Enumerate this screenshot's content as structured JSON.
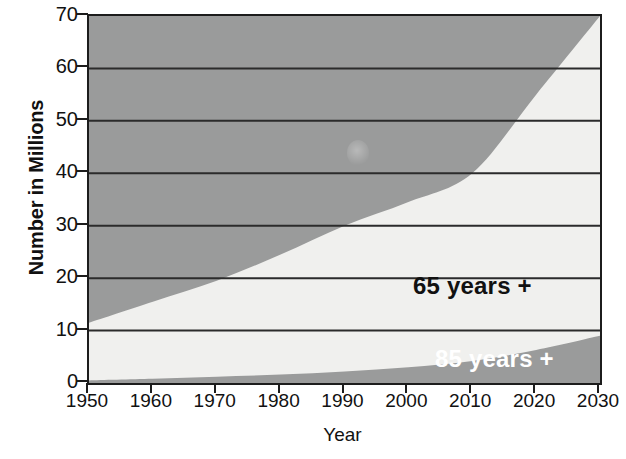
{
  "chart_data": {
    "type": "area",
    "title": "",
    "subtitle": "",
    "xlabel": "Year",
    "ylabel": "Number in Millions",
    "xlim": [
      1950,
      2030
    ],
    "ylim": [
      0,
      70
    ],
    "xticks": [
      1950,
      1960,
      1970,
      1980,
      1990,
      2000,
      2010,
      2020,
      2030
    ],
    "yticks": [
      0,
      10,
      20,
      30,
      40,
      50,
      60,
      70
    ],
    "xtick_labels": [
      "1950",
      "1960",
      "1970",
      "1980",
      "1990",
      "2000",
      "2010",
      "2020",
      "2030"
    ],
    "ytick_labels": [
      "0",
      "10",
      "20",
      "30",
      "40",
      "50",
      "60",
      "70"
    ],
    "grid": true,
    "grid_axis": "y",
    "stacked": true,
    "legend": "in-plot annotations",
    "x": [
      1950,
      1960,
      1970,
      1980,
      1990,
      2000,
      2010,
      2020,
      2030
    ],
    "series": [
      {
        "name": "65 years +",
        "label": "65 years +",
        "color": "#f0f0ee",
        "label_color": "#111111",
        "values": [
          11.5,
          15.5,
          19.5,
          24.5,
          30.0,
          34.5,
          40.0,
          55.0,
          70.0
        ]
      },
      {
        "name": "85 years +",
        "label": "85 years +",
        "color": "#9a9b9b",
        "label_color": "#ffffff",
        "values": [
          0.5,
          0.8,
          1.2,
          1.6,
          2.2,
          3.0,
          4.2,
          6.3,
          9.0
        ]
      }
    ],
    "colors": {
      "background_above_area": "#9a9b9b",
      "area_65_plus": "#f0f0ee",
      "area_85_plus": "#9a9b9b",
      "gridline": "#2b2b2b",
      "axis": "#1c1c1c",
      "text": "#111111",
      "figure_background": "#ffffff"
    }
  },
  "axes": {
    "y_title": "Number in Millions",
    "x_title": "Year"
  }
}
